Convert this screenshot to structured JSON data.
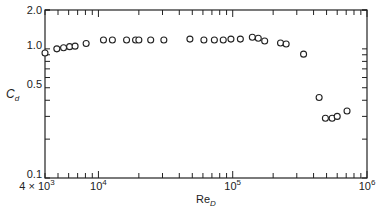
{
  "chart_data": {
    "type": "scatter",
    "title": "",
    "xlabel": "Re",
    "xlabel_subscript": "D",
    "ylabel": "C",
    "ylabel_subscript": "d",
    "xscale": "log",
    "yscale": "log",
    "xlim": [
      4000,
      1000000
    ],
    "ylim": [
      0.1,
      2.0
    ],
    "grid": false,
    "legend": null,
    "x_ticks": [
      {
        "value": 4000,
        "label_base": "4 × 10",
        "label_exp": "3"
      },
      {
        "value": 10000,
        "label_base": "10",
        "label_exp": "4"
      },
      {
        "value": 100000,
        "label_base": "10",
        "label_exp": "5"
      },
      {
        "value": 1000000,
        "label_base": "10",
        "label_exp": "6"
      }
    ],
    "y_ticks": [
      {
        "value": 2.0,
        "label": "2.0"
      },
      {
        "value": 1.0,
        "label": "1.0"
      },
      {
        "value": 0.5,
        "label": "0.5"
      },
      {
        "value": 0.1,
        "label": "0.1"
      }
    ],
    "series": [
      {
        "name": "C_d vs Re_D",
        "marker": "open-circle",
        "x": [
          4000,
          4900,
          5500,
          6100,
          6700,
          8100,
          10900,
          12700,
          16200,
          18900,
          20000,
          24500,
          30700,
          48000,
          61000,
          73000,
          85000,
          97000,
          114000,
          140000,
          155000,
          173000,
          227000,
          250000,
          337000,
          440000,
          490000,
          550000,
          600000,
          710000
        ],
        "y": [
          0.93,
          1.0,
          1.02,
          1.04,
          1.05,
          1.1,
          1.17,
          1.17,
          1.17,
          1.17,
          1.17,
          1.17,
          1.17,
          1.19,
          1.17,
          1.17,
          1.17,
          1.19,
          1.19,
          1.23,
          1.21,
          1.15,
          1.11,
          1.09,
          0.91,
          0.42,
          0.29,
          0.29,
          0.3,
          0.33
        ]
      }
    ]
  }
}
